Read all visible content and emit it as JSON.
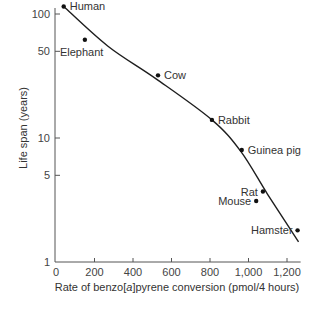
{
  "chart_data": {
    "type": "scatter",
    "title": "",
    "xlabel": "Rate of benzo[a]pyrene conversion (pmol/4 hours)",
    "xlabel_parts": [
      "Rate of benzo[",
      "a",
      "]pyrene conversion (pmol/4 hours)"
    ],
    "ylabel": "Life span (years)",
    "xlim": [
      0,
      1250
    ],
    "ylim": [
      1,
      110
    ],
    "yscale": "log",
    "grid": false,
    "legend": null,
    "x_ticks": [
      {
        "value": 0,
        "label": "0"
      },
      {
        "value": 200,
        "label": "200"
      },
      {
        "value": 400,
        "label": "400"
      },
      {
        "value": 600,
        "label": "600"
      },
      {
        "value": 800,
        "label": "800"
      },
      {
        "value": 1000,
        "label": "1,000"
      },
      {
        "value": 1200,
        "label": "1,200"
      }
    ],
    "y_ticks": [
      {
        "value": 1,
        "label": "1"
      },
      {
        "value": 5,
        "label": "5"
      },
      {
        "value": 10,
        "label": "10"
      },
      {
        "value": 50,
        "label": "50"
      },
      {
        "value": 100,
        "label": "100"
      }
    ],
    "points": [
      {
        "name": "Human",
        "x": 40,
        "y": 115,
        "label_pos": "right"
      },
      {
        "name": "Elephant",
        "x": 150,
        "y": 62,
        "label_pos": "below-left"
      },
      {
        "name": "Cow",
        "x": 530,
        "y": 32,
        "label_pos": "right"
      },
      {
        "name": "Rabbit",
        "x": 810,
        "y": 14,
        "label_pos": "right"
      },
      {
        "name": "Guinea pig",
        "x": 965,
        "y": 8,
        "label_pos": "right"
      },
      {
        "name": "Rat",
        "x": 1075,
        "y": 3.7,
        "label_pos": "left"
      },
      {
        "name": "Mouse",
        "x": 1040,
        "y": 3.1,
        "label_pos": "left"
      },
      {
        "name": "Hamster",
        "x": 1255,
        "y": 1.8,
        "label_pos": "left"
      }
    ],
    "trend_line": {
      "description": "curved fit line, decreasing",
      "points": [
        {
          "x": 40,
          "y": 115
        },
        {
          "x": 270,
          "y": 55
        },
        {
          "x": 520,
          "y": 30
        },
        {
          "x": 810,
          "y": 14
        },
        {
          "x": 960,
          "y": 7.8
        },
        {
          "x": 1100,
          "y": 3.5
        },
        {
          "x": 1260,
          "y": 1.45
        }
      ]
    }
  }
}
